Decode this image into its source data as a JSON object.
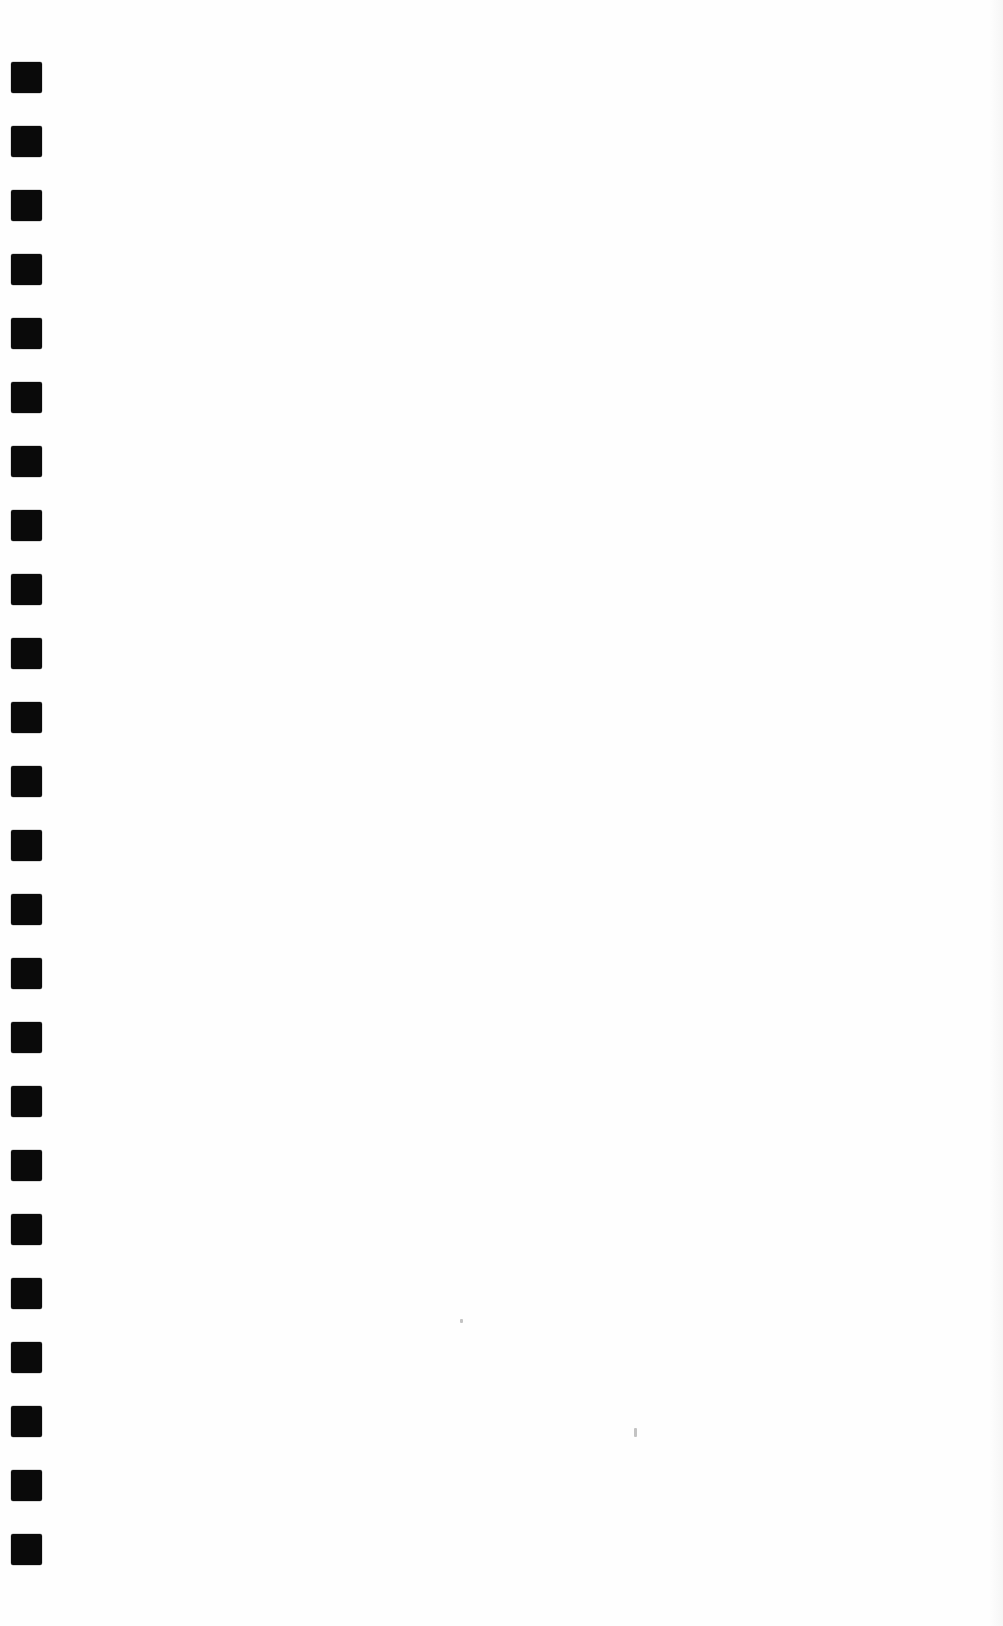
{
  "page": {
    "width": 1003,
    "height": 1626,
    "background_color": "#fefefe",
    "content_text": "",
    "body_text_present": false
  },
  "binding_marks": {
    "name": "spiral-binding-punch-marks",
    "count": 24,
    "color": "#0a0a0a",
    "shape": "rounded-square",
    "corner_radius_px": 2,
    "left_px": 11,
    "width_px": 31,
    "height_px": 31,
    "first_top_px": 62,
    "pitch_px": 64,
    "tops_px": [
      62,
      126,
      190,
      254,
      318,
      382,
      446,
      510,
      574,
      638,
      702,
      766,
      830,
      894,
      958,
      1022,
      1086,
      1150,
      1214,
      1278,
      1342,
      1406,
      1470,
      1534
    ]
  },
  "artifacts": {
    "name": "scan-specks",
    "color": "#b9b9b9",
    "items": [
      {
        "left_px": 634,
        "top_px": 1428,
        "width_px": 3,
        "height_px": 9
      },
      {
        "left_px": 460,
        "top_px": 1319,
        "width_px": 3,
        "height_px": 4
      }
    ]
  },
  "scan_edge": {
    "name": "right-edge-shading",
    "color": "#f6f6f6"
  }
}
